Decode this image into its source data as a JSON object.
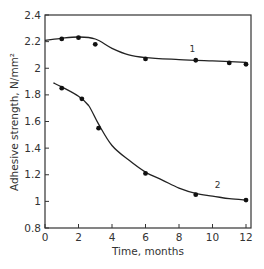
{
  "chart_data": {
    "type": "line",
    "title": "",
    "xlabel": "Time, months",
    "ylabel": "Adhesive strength, N/mm²",
    "xlim": [
      0,
      12.3
    ],
    "ylim": [
      0.8,
      2.4
    ],
    "xticks": [
      0,
      2,
      4,
      6,
      8,
      10,
      12
    ],
    "yticks": [
      0.8,
      1,
      1.2,
      1.4,
      1.6,
      1.8,
      2,
      2.2,
      2.4
    ],
    "xtick_labels": [
      "0",
      "2",
      "4",
      "6",
      "8",
      "10",
      "12"
    ],
    "ytick_labels": [
      "0.8",
      "1",
      "1.2",
      "1.4",
      "1.6",
      "1.8",
      "2",
      "2.2",
      "2.4"
    ],
    "grid": false,
    "legend": "inline curve labels",
    "series": [
      {
        "name": "1",
        "points": [
          [
            1,
            2.22
          ],
          [
            2,
            2.23
          ],
          [
            3,
            2.18
          ],
          [
            6,
            2.07
          ],
          [
            9,
            2.06
          ],
          [
            11,
            2.04
          ],
          [
            12,
            2.03
          ]
        ],
        "curve": [
          [
            0,
            2.21
          ],
          [
            1,
            2.225
          ],
          [
            2,
            2.235
          ],
          [
            3,
            2.22
          ],
          [
            4,
            2.15
          ],
          [
            5,
            2.1
          ],
          [
            6,
            2.08
          ],
          [
            8,
            2.065
          ],
          [
            10,
            2.055
          ],
          [
            12,
            2.045
          ]
        ],
        "label_pos": [
          8.8,
          2.12
        ]
      },
      {
        "name": "2",
        "points": [
          [
            1,
            1.85
          ],
          [
            2.2,
            1.77
          ],
          [
            3.2,
            1.55
          ],
          [
            6,
            1.21
          ],
          [
            9,
            1.05
          ],
          [
            12,
            1.01
          ]
        ],
        "curve": [
          [
            0.5,
            1.89
          ],
          [
            1,
            1.86
          ],
          [
            2,
            1.79
          ],
          [
            2.6,
            1.72
          ],
          [
            3.2,
            1.58
          ],
          [
            4,
            1.42
          ],
          [
            5,
            1.31
          ],
          [
            6,
            1.22
          ],
          [
            7,
            1.16
          ],
          [
            8,
            1.1
          ],
          [
            9,
            1.06
          ],
          [
            10,
            1.04
          ],
          [
            11,
            1.02
          ],
          [
            12,
            1.01
          ]
        ],
        "label_pos": [
          10.3,
          1.1
        ]
      }
    ]
  },
  "caption": "… … … …"
}
